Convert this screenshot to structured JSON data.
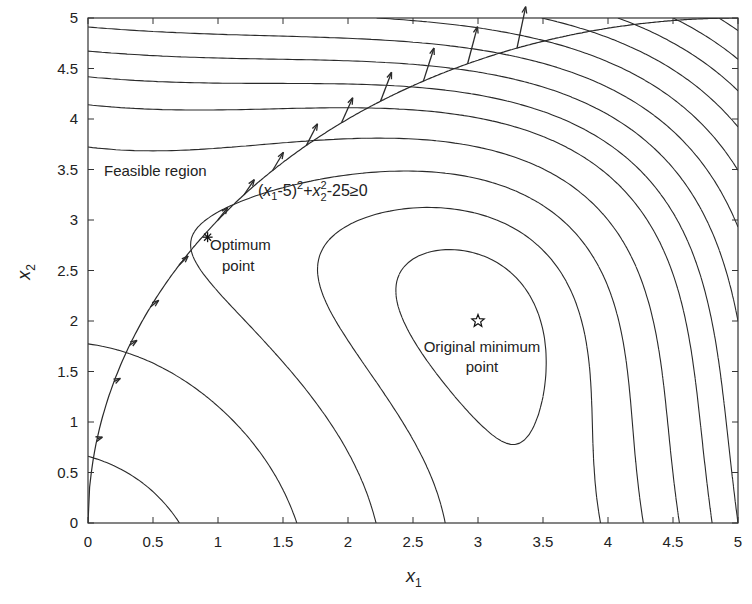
{
  "chart_data": {
    "type": "contour",
    "title": "",
    "xlabel": "x1",
    "ylabel": "x2",
    "xlim": [
      0,
      5
    ],
    "ylim": [
      0,
      5
    ],
    "xticks": [
      "0",
      "0.5",
      "1",
      "1.5",
      "2",
      "2.5",
      "3",
      "3.5",
      "4",
      "4.5",
      "5"
    ],
    "yticks": [
      "0",
      "0.5",
      "1",
      "1.5",
      "2",
      "2.5",
      "3",
      "3.5",
      "4",
      "4.5",
      "5"
    ],
    "grid": false,
    "function": "f(x1,x2) = (x1^2 + x2 - 11)^2 + (x1 + x2^2 - 7)^2",
    "contour_levels": [
      10,
      30,
      60,
      100,
      150,
      200,
      260,
      330,
      410,
      500,
      600,
      710,
      830,
      960,
      1100,
      1250,
      1410,
      1580,
      1760,
      1950,
      2150
    ],
    "constraint": {
      "expression": "(x1-5)^2 + x2^2 - 25 >= 0",
      "curve": "x2 = sqrt(25 - (x1-5)^2)"
    },
    "gradient_arrows_x1": [
      0.07,
      0.2,
      0.32,
      0.48,
      0.7,
      1.0,
      1.2,
      1.42,
      1.68,
      1.95,
      2.25,
      2.58,
      2.92,
      3.3
    ],
    "points": [
      {
        "name": "Optimum point",
        "x1": 0.92,
        "x2": 2.83,
        "marker": "asterisk"
      },
      {
        "name": "Original minimum point",
        "x1": 3.0,
        "x2": 2.0,
        "marker": "star"
      }
    ],
    "annotations": [
      {
        "text": "Feasible region",
        "x1": 0.12,
        "x2": 3.45
      },
      {
        "text": "Optimum point",
        "x1": 0.97,
        "x2": 2.75
      },
      {
        "text": "Original minimum point",
        "x1": 3.0,
        "x2": 1.7
      }
    ]
  },
  "labels": {
    "xlabel_main": "x",
    "xlabel_sub": "1",
    "ylabel_main": "x",
    "ylabel_sub": "2",
    "feasible": "Feasible region",
    "optimum_l1": "Optimum",
    "optimum_l2": "point",
    "original_l1": "Original minimum",
    "original_l2": "point",
    "constraint_x": "x",
    "constraint_s1": "1",
    "constraint_a": "-5)",
    "constraint_p": "2",
    "constraint_plus": "+",
    "constraint_x2": "x",
    "constraint_s2": "2",
    "constraint_p2": "2",
    "constraint_tail": "-25≥0",
    "constraint_open": "("
  },
  "colors": {
    "line": "#2a2a2a",
    "axis": "#333333",
    "background": "#ffffff"
  }
}
